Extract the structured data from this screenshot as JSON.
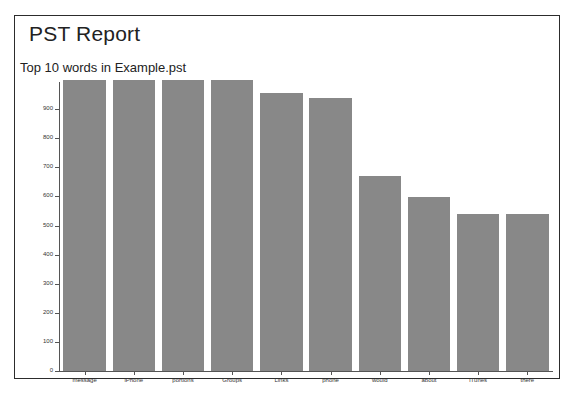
{
  "report": {
    "title": "PST Report",
    "subtitle": "Top 10 words in Example.pst"
  },
  "chart_data": {
    "type": "bar",
    "title": "Top 10 words in Example.pst",
    "xlabel": "",
    "ylabel": "",
    "ylim": [
      0,
      1000
    ],
    "grid": false,
    "legend": "none",
    "bar_color": "#888888",
    "categories": [
      "message",
      "iPhone",
      "portions",
      "Groups",
      "Links",
      "phone",
      "would",
      "about",
      "iTunes",
      "there"
    ],
    "values": [
      1000,
      1000,
      1000,
      1000,
      955,
      938,
      670,
      598,
      538,
      538
    ],
    "y_ticks": [
      0,
      100,
      200,
      300,
      400,
      500,
      600,
      700,
      800,
      900
    ],
    "y_tick_labels": [
      "0",
      "100",
      "200",
      "300",
      "400",
      "500",
      "600",
      "700",
      "800",
      "900"
    ]
  }
}
